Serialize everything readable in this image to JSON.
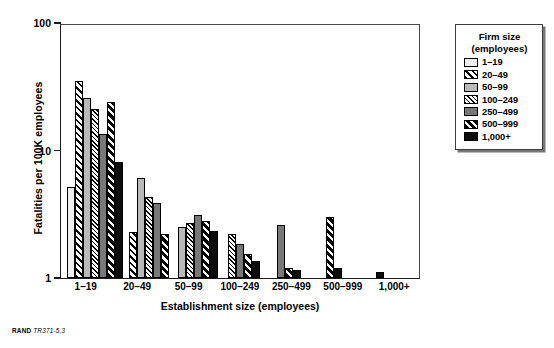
{
  "footer": {
    "brand": "RAND",
    "code": "TR371-5.3"
  },
  "legend": {
    "title_line1": "Firm size",
    "title_line2": "(employees)",
    "position": "right"
  },
  "chart_data": {
    "type": "bar",
    "title": "",
    "subtitle": "",
    "xlabel": "Establishment size (employees)",
    "ylabel": "Fatalities per 100K employees",
    "yscale": "log",
    "ylim": [
      1,
      100
    ],
    "ytick_labels": [
      "1",
      "10",
      "100"
    ],
    "ytick_values": [
      1,
      10,
      100
    ],
    "grid": false,
    "categories": [
      "1–19",
      "20–49",
      "50–99",
      "100–249",
      "250–499",
      "500–999",
      "1,000+"
    ],
    "series": [
      {
        "name": "1–19",
        "values": [
          5.2,
          null,
          null,
          null,
          null,
          null,
          null
        ]
      },
      {
        "name": "20–49",
        "values": [
          35.0,
          2.3,
          null,
          null,
          null,
          null,
          null
        ]
      },
      {
        "name": "50–99",
        "values": [
          26.0,
          6.1,
          2.5,
          null,
          null,
          null,
          null
        ]
      },
      {
        "name": "100–249",
        "values": [
          21.0,
          4.3,
          2.7,
          2.2,
          null,
          null,
          null
        ]
      },
      {
        "name": "250–499",
        "values": [
          13.5,
          3.9,
          3.1,
          1.85,
          2.6,
          null,
          null
        ]
      },
      {
        "name": "500–999",
        "values": [
          24.0,
          2.2,
          2.8,
          1.55,
          1.2,
          3.0,
          null
        ]
      },
      {
        "name": "1,000+",
        "values": [
          8.2,
          null,
          2.35,
          1.35,
          1.15,
          1.2,
          1.12
        ]
      }
    ]
  }
}
